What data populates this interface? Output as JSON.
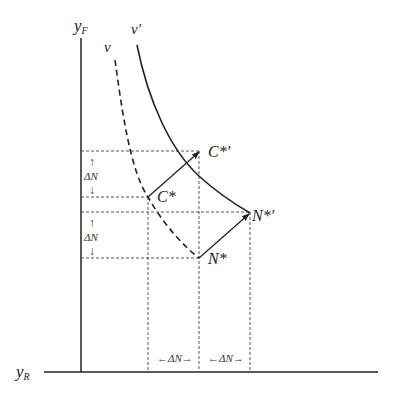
{
  "diagram": {
    "axes": {
      "y_axis_label": "y",
      "y_axis_sub": "F",
      "x_axis_label": "y",
      "x_axis_sub": "R"
    },
    "curves": {
      "v_label": "v",
      "v_prime_label": "v′"
    },
    "points": {
      "c_star": "C*",
      "c_star_prime": "C*′",
      "n_star": "N*",
      "n_star_prime": "N*′"
    },
    "deltas": {
      "vertical_upper": "ΔN",
      "vertical_lower": "ΔN",
      "horizontal_left": "←ΔN→",
      "horizontal_right": "←ΔN→",
      "up_arrow": "↑",
      "down_arrow": "↓"
    },
    "colors": {
      "line": "#222222",
      "dashed": "#333333"
    }
  }
}
